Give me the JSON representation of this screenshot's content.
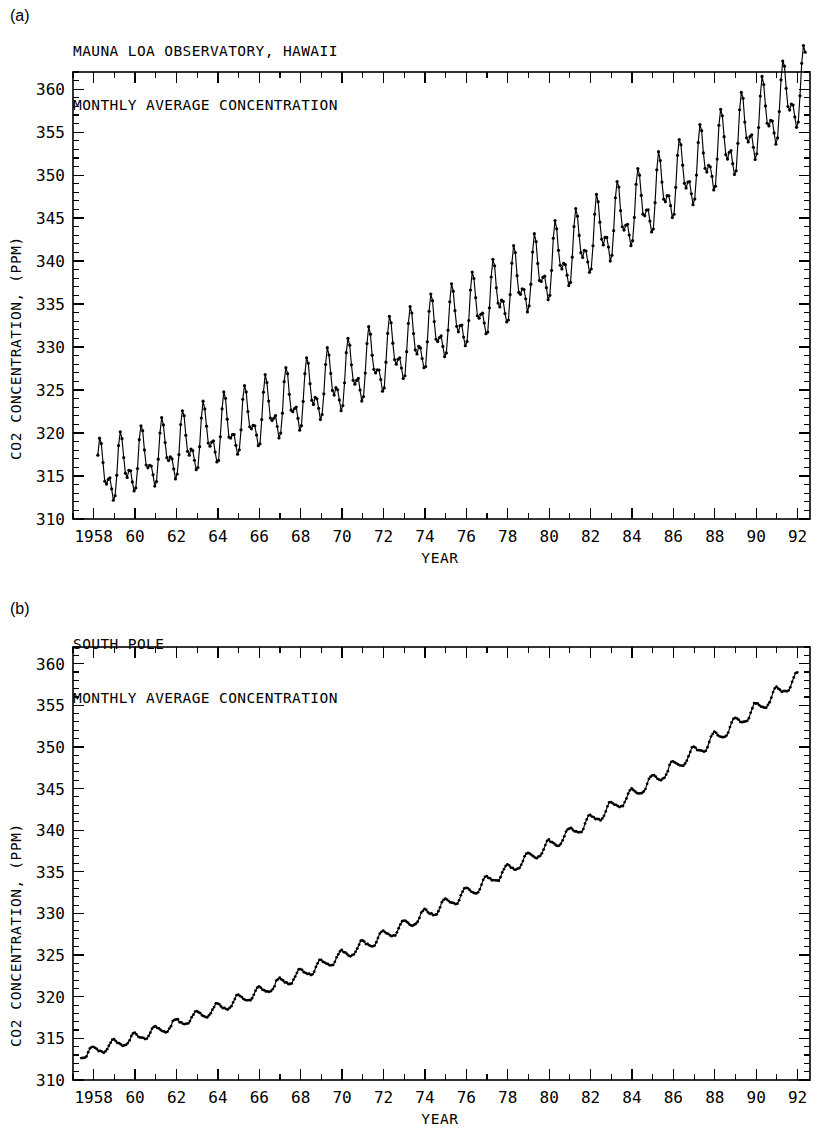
{
  "figure": {
    "background": "#ffffff",
    "ink": "#000000",
    "width": 825,
    "height": 1139
  },
  "panels": [
    {
      "letter": "(a)",
      "title_line1": "MAUNA LOA OBSERVATORY, HAWAII",
      "title_line2": "MONTHLY AVERAGE CONCENTRATION",
      "ylabel": "CO2 CONCENTRATION, (PPM)",
      "xlabel": "YEAR"
    },
    {
      "letter": "(b)",
      "title_line1": "SOUTH POLE",
      "title_line2": "MONTHLY AVERAGE CONCENTRATION",
      "ylabel": "CO2 CONCENTRATION, (PPM)",
      "xlabel": "YEAR"
    }
  ],
  "chart_data": [
    {
      "type": "line",
      "title": "MAUNA LOA OBSERVATORY, HAWAII — MONTHLY AVERAGE CONCENTRATION",
      "panel": "(a)",
      "xlabel": "YEAR",
      "ylabel": "CO2 CONCENTRATION, (PPM)",
      "xlim": [
        1957.0,
        1992.6
      ],
      "ylim": [
        310,
        362
      ],
      "y_major_ticks": [
        310,
        315,
        320,
        325,
        330,
        335,
        340,
        345,
        350,
        355,
        360
      ],
      "y_minor_step": 1,
      "x_major_ticks": [
        1958,
        1960,
        1962,
        1964,
        1966,
        1968,
        1970,
        1972,
        1974,
        1976,
        1978,
        1980,
        1982,
        1984,
        1986,
        1988,
        1990,
        1992
      ],
      "x_major_tick_labels": [
        "1958",
        "60",
        "62",
        "64",
        "66",
        "68",
        "70",
        "72",
        "74",
        "76",
        "78",
        "80",
        "82",
        "84",
        "86",
        "88",
        "90",
        "92"
      ],
      "x_minor_step": 1,
      "grid": false,
      "legend": null,
      "markers": "filled-dot",
      "marker_size": 1.6,
      "series_generator": {
        "description": "Monthly mean atmospheric CO2 at Mauna Loa; quadratic secular trend plus seasonal cycle peaking in May and minimum in late September/October.",
        "start_year": 1958.2,
        "end_year": 1992.4,
        "samples_per_year": 12,
        "trend_type": "quadratic",
        "trend_c0": 315.2,
        "trend_c1": 0.76,
        "trend_c2": 0.0168,
        "trend_ref_year": 1958.5,
        "seasonal_amplitude_start": 2.75,
        "seasonal_amplitude_end": 3.3,
        "seasonal_peak_month": 5.2,
        "seasonal_harmonic2": 0.65,
        "noise_amplitude": 0.18
      },
      "annotations": {
        "start_value_ppm": 315.7,
        "end_value_ppm": 356.9,
        "peak_value_ppm": 358.6,
        "first_minimum_ppm": 312.5,
        "seasonal_peak_to_trough_ppm": 6.2,
        "total_rise_ppm": 41
      }
    },
    {
      "type": "line",
      "title": "SOUTH POLE — MONTHLY AVERAGE CONCENTRATION",
      "panel": "(b)",
      "xlabel": "YEAR",
      "ylabel": "CO2 CONCENTRATION, (PPM)",
      "xlim": [
        1957.0,
        1992.6
      ],
      "ylim": [
        310,
        362
      ],
      "y_major_ticks": [
        310,
        315,
        320,
        325,
        330,
        335,
        340,
        345,
        350,
        355,
        360
      ],
      "y_minor_step": 1,
      "x_major_ticks": [
        1958,
        1960,
        1962,
        1964,
        1966,
        1968,
        1970,
        1972,
        1974,
        1976,
        1978,
        1980,
        1982,
        1984,
        1986,
        1988,
        1990,
        1992
      ],
      "x_major_tick_labels": [
        "1958",
        "60",
        "62",
        "64",
        "66",
        "68",
        "70",
        "72",
        "74",
        "76",
        "78",
        "80",
        "82",
        "84",
        "86",
        "88",
        "90",
        "92"
      ],
      "x_minor_step": 1,
      "grid": false,
      "legend": null,
      "markers": "filled-dot",
      "marker_size": 1.4,
      "series_generator": {
        "description": "Monthly mean atmospheric CO2 at the South Pole; same secular rise but a much smaller, phase-shifted Southern Hemisphere seasonal cycle.",
        "start_year": 1957.4,
        "end_year": 1992.0,
        "samples_per_year": 12,
        "trend_type": "quadratic",
        "trend_c0": 313.1,
        "trend_c1": 0.74,
        "trend_c2": 0.0165,
        "trend_ref_year": 1957.5,
        "seasonal_amplitude_start": 0.55,
        "seasonal_amplitude_end": 0.72,
        "seasonal_peak_month": 0.6,
        "seasonal_harmonic2": 0.18,
        "noise_amplitude": 0.1
      },
      "annotations": {
        "start_value_ppm": 313.0,
        "end_value_ppm": 353.2,
        "peak_value_ppm": 353.5,
        "seasonal_peak_to_trough_ppm": 1.3,
        "total_rise_ppm": 40
      }
    }
  ]
}
